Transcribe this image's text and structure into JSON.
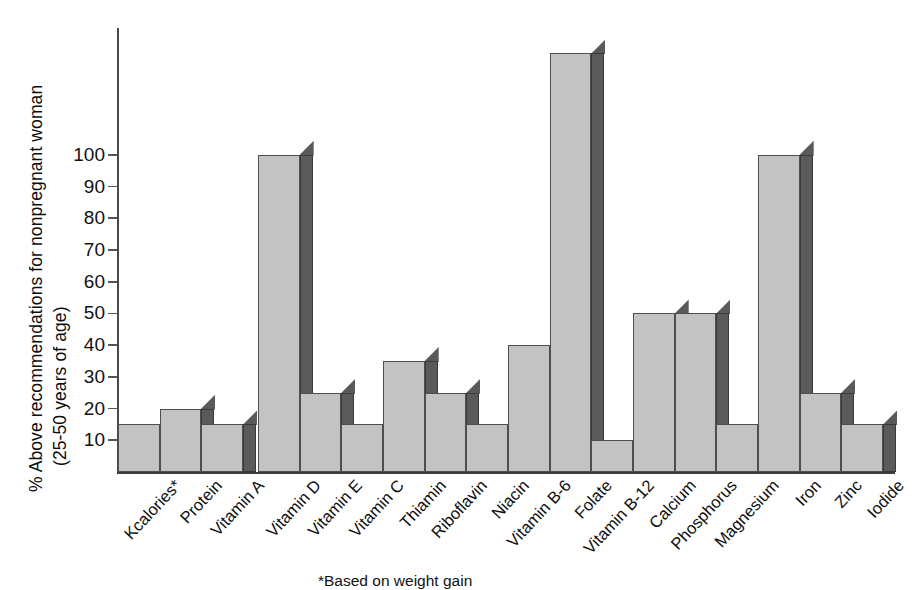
{
  "chart_data": {
    "type": "bar",
    "title": "",
    "xlabel": "",
    "ylabel_line1": "% Above recommendations for nonpregnant woman",
    "ylabel_line2": "(25-50 years of age)",
    "ylim": [
      0,
      140
    ],
    "yticks": [
      10,
      20,
      30,
      40,
      50,
      60,
      70,
      80,
      90,
      100
    ],
    "ytick_labels": [
      "10",
      "20",
      "30",
      "40",
      "50",
      "60",
      "70",
      "80",
      "90",
      "100"
    ],
    "grid": false,
    "legend": "none",
    "style": "3d-bar",
    "categories": [
      "Kcalories*",
      "Protein",
      "Vitamin A",
      "Vitamin D",
      "Vitamin E",
      "Vitamin C",
      "Thiamin",
      "Riboflavin",
      "Niacin",
      "Vitamin B-6",
      "Folate",
      "Vitamin B-12",
      "Calcium",
      "Phosphorus",
      "Magnesium",
      "Iron",
      "Zinc",
      "Iodide"
    ],
    "values": [
      15,
      20,
      15,
      100,
      25,
      15,
      35,
      25,
      15,
      40,
      132,
      10,
      50,
      50,
      15,
      100,
      25,
      15
    ],
    "colors": {
      "bar_front": "#c3c3c3",
      "bar_side": "#5a5a5a",
      "bar_outline": "#4f4f4f",
      "axis": "#4a4a4a",
      "text": "#111111",
      "background": "#ffffff"
    },
    "annotations": {
      "footnote": "*Based on weight gain"
    }
  }
}
